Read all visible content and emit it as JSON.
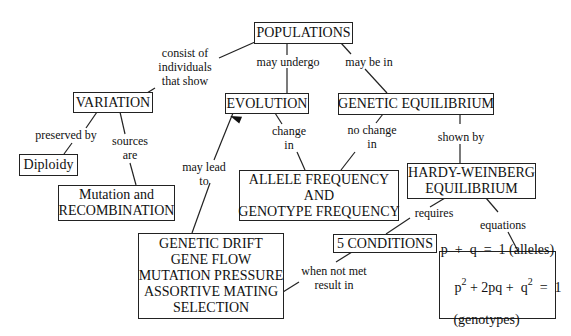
{
  "concept_map": {
    "nodes": {
      "populations": "POPULATIONS",
      "variation": "VARIATION",
      "evolution": "EVOLUTION",
      "genetic_equilibrium": "GENETIC EQUILIBRIUM",
      "diploidy": "Diploidy",
      "mutation_recombination": [
        "Mutation and",
        "RECOMBINATION"
      ],
      "allele_genotype_frequency": [
        "ALLELE FREQUENCY",
        "AND",
        "GENOTYPE FREQUENCY"
      ],
      "hardy_weinberg": [
        "HARDY-WEINBERG",
        "EQUILIBRIUM"
      ],
      "five_conditions": "5 CONDITIONS",
      "mechanisms": [
        "GENETIC DRIFT",
        "GENE FLOW",
        "MUTATION PRESSURE",
        "ASSORTIVE MATING",
        "SELECTION"
      ],
      "equations": {
        "line1": "p  +  q  =  1 (alleles)",
        "line2_p": "p",
        "line2_exp1": "2",
        "line2_mid": " + 2pq +  q",
        "line2_exp2": "2",
        "line2_end": "  =  1",
        "line3": "(genotypes)"
      }
    },
    "links": {
      "consist_of": [
        "consist of",
        "individuals",
        "that show"
      ],
      "may_undergo": "may undergo",
      "may_be_in": "may be in",
      "preserved_by": "preserved by",
      "sources_are": [
        "sources",
        "are"
      ],
      "change_in": [
        "change",
        "in"
      ],
      "no_change_in": [
        "no change",
        "in"
      ],
      "shown_by": "shown by",
      "may_lead_to": [
        "may lead",
        "to"
      ],
      "requires": "requires",
      "equations": "equations",
      "when_not_met": [
        "when not met",
        "result in"
      ]
    }
  }
}
